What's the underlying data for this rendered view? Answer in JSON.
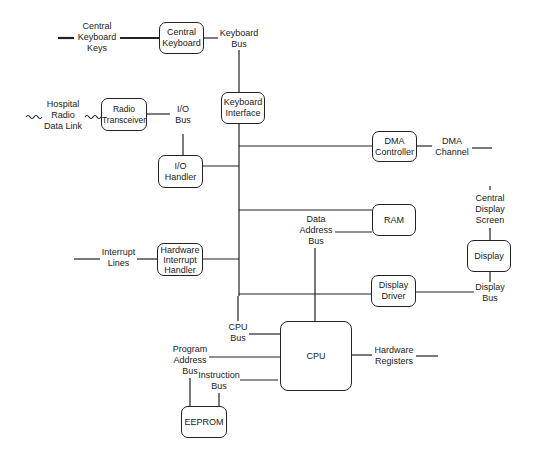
{
  "diagram": {
    "type": "block-diagram",
    "blocks": {
      "central_keyboard": "Central\nKeyboard",
      "keyboard_interface": "Keyboard\nInterface",
      "radio_transceiver": "Radio\nTransceiver",
      "io_handler": "I/O\nHandler",
      "dma_controller": "DMA\nController",
      "ram": "RAM",
      "display": "Display",
      "hardware_interrupt_handler": "Hardware\nInterrupt\nHandler",
      "display_driver": "Display\nDriver",
      "cpu": "CPU",
      "eeprom": "EEPROM"
    },
    "labels": {
      "central_keyboard_keys": "Central\nKeyboard\nKeys",
      "keyboard_bus": "Keyboard\nBus",
      "hospital_radio_data_link": "Hospital\nRadio\nData Link",
      "io_bus": "I/O\nBus",
      "dma_channel": "DMA\nChannel",
      "central_display_screen": "Central\nDisplay\nScreen",
      "data_address_bus": "Data\nAddress\nBus",
      "interrupt_lines": "Interrupt\nLines",
      "display_bus": "Display\nBus",
      "cpu_bus": "CPU\nBus",
      "program_address_bus": "Program\nAddress\nBus",
      "instruction_bus": "Instruction\nBus",
      "hardware_registers": "Hardware\nRegisters"
    }
  }
}
